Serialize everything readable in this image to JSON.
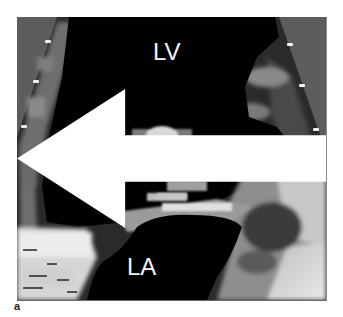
{
  "figure": {
    "panel_label": "a",
    "image_type": "echocardiogram",
    "labels": {
      "upper_chamber": "LV",
      "lower_chamber": "LA"
    },
    "annotations": [
      {
        "type": "arrow",
        "direction": "left",
        "color": "#ffffff",
        "target": "echogenic mass near mitral valve"
      }
    ],
    "colors": {
      "background": "#ffffff",
      "sector_outside": "#5a5a5a",
      "cavity": "#000000",
      "label_text": "#f4f4f4"
    }
  }
}
